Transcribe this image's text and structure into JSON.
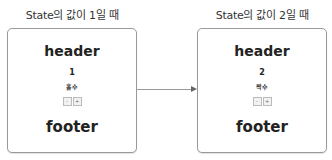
{
  "left": {
    "caption": "State의 값이 1일 때",
    "header": "header",
    "value": "1",
    "parity": "홀수",
    "minus_label": "-",
    "plus_label": "+",
    "footer": "footer"
  },
  "right": {
    "caption": "State의 값이 2일 때",
    "header": "header",
    "value": "2",
    "parity": "짝수",
    "minus_label": "-",
    "plus_label": "+",
    "footer": "footer"
  },
  "arrow": {
    "direction": "left-to-right",
    "color": "#999999"
  }
}
